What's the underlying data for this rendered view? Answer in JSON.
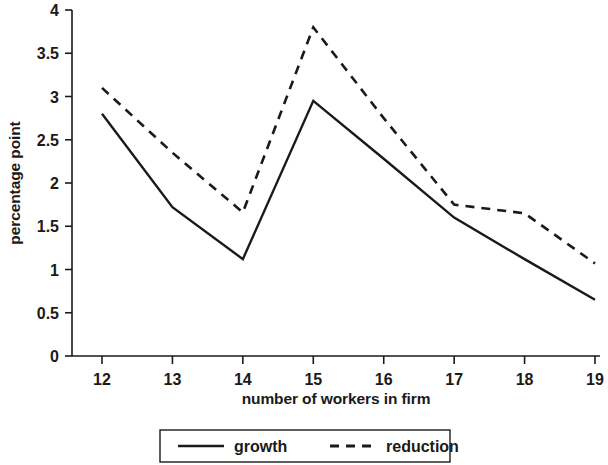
{
  "chart_data": {
    "type": "line",
    "title": "",
    "xlabel": "number of workers in firm",
    "ylabel": "percentage point",
    "x": [
      12,
      13,
      14,
      15,
      16,
      17,
      18,
      19
    ],
    "xticklabels": [
      "12",
      "13",
      "14",
      "15",
      "16",
      "17",
      "18",
      "19"
    ],
    "yticklabels": [
      "0",
      "0.5",
      "1",
      "1.5",
      "2",
      "2.5",
      "3",
      "3.5",
      "4"
    ],
    "yticks": [
      0,
      0.5,
      1,
      1.5,
      2,
      2.5,
      3,
      3.5,
      4
    ],
    "xlim": [
      11.6,
      19.4
    ],
    "ylim": [
      0,
      4
    ],
    "grid": false,
    "legend_position": "bottom",
    "series": [
      {
        "name": "growth",
        "style": "solid",
        "color": "#1a1a1a",
        "values": [
          2.8,
          1.72,
          1.12,
          2.95,
          2.28,
          1.6,
          1.12,
          0.65
        ]
      },
      {
        "name": "reduction",
        "style": "dashed",
        "color": "#1a1a1a",
        "values": [
          3.1,
          2.35,
          1.66,
          3.8,
          2.75,
          1.75,
          1.65,
          1.07
        ]
      }
    ]
  },
  "legend": {
    "items": [
      {
        "label": "growth",
        "style": "solid"
      },
      {
        "label": "reduction",
        "style": "dashed"
      }
    ]
  },
  "axes": {
    "x_axis_title": "number of workers in firm",
    "y_axis_title": "percentage point"
  }
}
